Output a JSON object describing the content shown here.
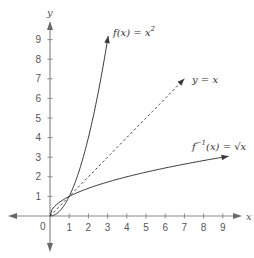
{
  "chart_data": {
    "type": "line",
    "title": "",
    "xlabel": "x",
    "ylabel": "y",
    "xlim": [
      -2,
      10
    ],
    "ylim": [
      -2,
      10
    ],
    "grid": false,
    "x_ticks": [
      1,
      2,
      3,
      4,
      5,
      6,
      7,
      8,
      9
    ],
    "y_ticks": [
      1,
      2,
      3,
      4,
      5,
      6,
      7,
      8,
      9
    ],
    "origin_label": "0",
    "series": [
      {
        "name": "f(x) = x^2",
        "label_parts": {
          "main": "f(x) = x",
          "sup": "2"
        },
        "style": "solid",
        "function": "x^2",
        "x_range": [
          0,
          3.03
        ],
        "x": [
          0,
          0.5,
          1,
          1.5,
          2,
          2.5,
          3
        ],
        "y": [
          0,
          0.25,
          1,
          2.25,
          4,
          6.25,
          9
        ]
      },
      {
        "name": "y = x",
        "label_parts": {
          "main": "y = x",
          "sup": ""
        },
        "style": "dashed",
        "function": "x",
        "x_range": [
          0,
          7
        ],
        "x": [
          0,
          1,
          7
        ],
        "y": [
          0,
          1,
          7
        ]
      },
      {
        "name": "f^-1(x) = sqrt(x)",
        "label_parts": {
          "pre": "f",
          "sup": "−1",
          "main": "(x) = √x"
        },
        "style": "solid",
        "function": "sqrt(x)",
        "x_range": [
          0,
          9.3
        ],
        "x": [
          0,
          0.25,
          1,
          2.25,
          4,
          6.25,
          9
        ],
        "y": [
          0,
          0.5,
          1,
          1.5,
          2,
          2.5,
          3
        ]
      }
    ],
    "annotations": [
      {
        "text": "closed loop between x^2 and sqrt(x) from (0,0) to (1,1)",
        "type": "intersection-region"
      }
    ]
  }
}
